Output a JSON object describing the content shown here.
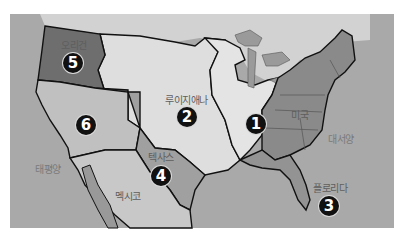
{
  "map": {
    "colors": {
      "ocean": "#a8a8a8",
      "land_light": "#dcdcdc",
      "canada": "#cfcfcf",
      "oregon": "#6e6e6e",
      "cession": "#bdbdbd",
      "texas": "#a0a0a0",
      "usa_original": "#8a8a8a",
      "florida": "#909090",
      "mexico": "#c6c6c6",
      "border": "#111111"
    },
    "regions": [
      {
        "id": "region-1",
        "number": "1",
        "label": ""
      },
      {
        "id": "region-2",
        "number": "2",
        "label": "루이지애나"
      },
      {
        "id": "region-3",
        "number": "3",
        "label": "플로리다"
      },
      {
        "id": "region-4",
        "number": "4",
        "label": "텍사스"
      },
      {
        "id": "region-5",
        "number": "5",
        "label": "오리건"
      },
      {
        "id": "region-6",
        "number": "6",
        "label": ""
      }
    ],
    "labels": {
      "usa": "미국",
      "mexico": "멕시코",
      "pacific": "태평양",
      "atlantic": "대서양"
    }
  }
}
